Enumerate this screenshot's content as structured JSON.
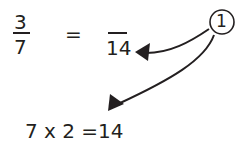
{
  "equation": {
    "left_fraction": {
      "numerator": "3",
      "denominator": "7"
    },
    "equals": "=",
    "right_fraction": {
      "numerator": "",
      "denominator": "14"
    }
  },
  "step_marker": {
    "label": "1"
  },
  "calculation": "7 x 2 =14",
  "colors": {
    "ink": "#231f20",
    "background": "#ffffff"
  }
}
